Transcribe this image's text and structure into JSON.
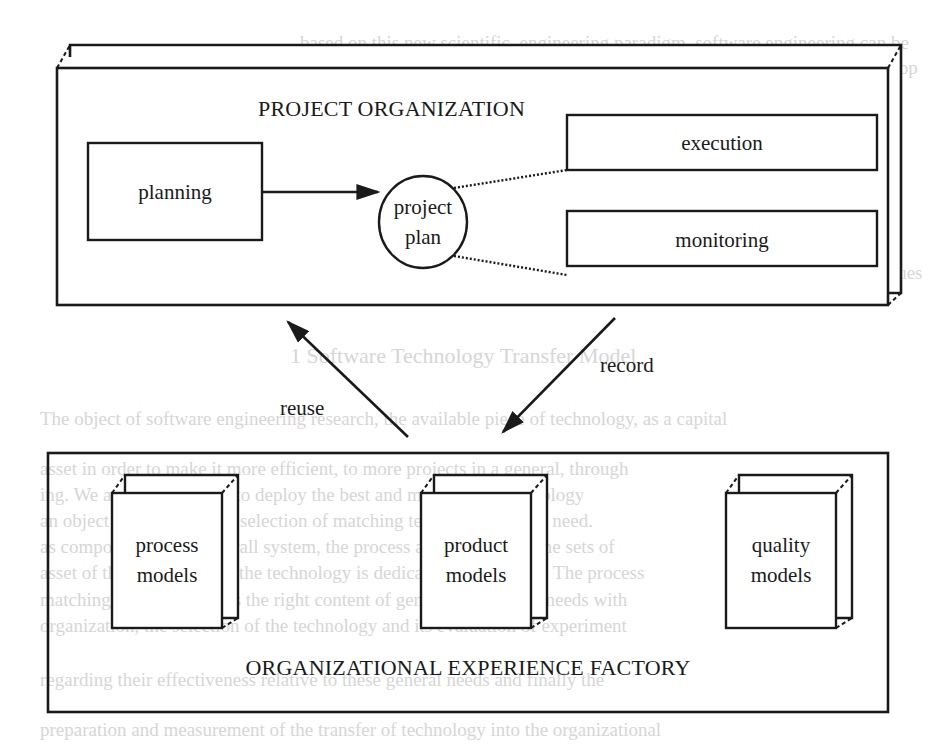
{
  "diagram": {
    "project_organization": {
      "title": "PROJECT ORGANIZATION",
      "planning": "planning",
      "project_plan_line1": "project",
      "project_plan_line2": "plan",
      "execution": "execution",
      "monitoring": "monitoring"
    },
    "flows": {
      "reuse": "reuse",
      "record": "record"
    },
    "experience_factory": {
      "title": "ORGANIZATIONAL EXPERIENCE FACTORY",
      "models": [
        {
          "line1": "process",
          "line2": "models"
        },
        {
          "line1": "product",
          "line2": "models"
        },
        {
          "line1": "quality",
          "line2": "models"
        }
      ]
    },
    "colors": {
      "ink": "#1a1a1a",
      "bleed_through": "#d6d6d6",
      "paper": "#ffffff"
    }
  },
  "bleed_through_text": {
    "line1": "based on this new scientific, engineering paradigm, software engineering can be",
    "line2": "defined as the subdiscipline of computer science that concentrates on the develop",
    "line3": "ment, and evolution of principles, techniques, methods, and tools for",
    "line4": "the rapid capture of software products",
    "line5": "the selection of appropriate evolution principles, techniques, methods",
    "line6": "tions, their integration into a project plan, and their application as",
    "line7": "project context; improvement models capable of analysis and style techniques",
    "heading": "1 Software Technology Transfer Model",
    "p2_1": "The object of software engineering research, the available piece of technology, as a capital",
    "p2_2": "asset in order to make it more efficient, to more projects in a general, through",
    "p2_3": "ing. We are not obligated to deploy the best and most useful technology",
    "p2_4": "an object of the types, the selection of matching technology for the need.",
    "p2_5": "as components of the overall system, the process automation and the sets of",
    "p2_6": "asset of the transaction of the technology is dedicated to its update. The process",
    "p2_7": "matching the two involves the right content of general technology needs with",
    "p2_8": "organization, the selection of the technology and its evaluation of experiment",
    "p2_9": "regarding their effectiveness relative to these general needs and finally the",
    "p2_10": "preparation and measurement of the transfer of technology into the organizational"
  }
}
